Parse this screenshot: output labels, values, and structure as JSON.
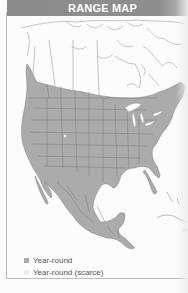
{
  "header": {
    "title": "RANGE MAP"
  },
  "map": {
    "region": "North America",
    "colors": {
      "range": "#a9a9a9",
      "range_scarce": "#e6e6e6",
      "land": "#fdfdfd",
      "borders": "#7d7d7d",
      "outline": "#9a9a9a"
    }
  },
  "legend": {
    "items": [
      {
        "label": "Year-round",
        "color": "#a9a9a9"
      },
      {
        "label": "Year-round (scarce)",
        "color": "#ececec"
      }
    ]
  }
}
